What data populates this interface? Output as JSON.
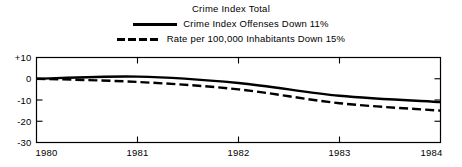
{
  "chart_data": {
    "type": "line",
    "title": "Crime Index Total",
    "xlabel": "",
    "ylabel": "",
    "x": [
      1980,
      1981,
      1982,
      1983,
      1984
    ],
    "xtick_labels": [
      "1980",
      "1981",
      "1982",
      "1983",
      "1984"
    ],
    "ytick_labels": [
      "+10",
      "0",
      "-10",
      "-20",
      "-30"
    ],
    "ytick_values": [
      10,
      0,
      -10,
      -20,
      -30
    ],
    "xlim": [
      1980,
      1984
    ],
    "ylim": [
      -30,
      10
    ],
    "grid": false,
    "legend_position": "top-center",
    "series": [
      {
        "name": "Crime Index Offenses Down 11%",
        "style": "solid",
        "color": "#000000",
        "values": [
          0,
          1,
          -2,
          -8,
          -11
        ]
      },
      {
        "name": "Rate per 100,000 Inhabitants Down 15%",
        "style": "dashed",
        "color": "#000000",
        "values": [
          0,
          -1.5,
          -5,
          -11.5,
          -15
        ]
      }
    ]
  },
  "legend": {
    "title": "Crime Index Total",
    "entries": [
      {
        "swatch": "solid-line-swatch",
        "label": "Crime Index Offenses Down 11%"
      },
      {
        "swatch": "dashed-line-swatch",
        "label": "Rate per 100,000 Inhabitants Down 15%"
      }
    ]
  },
  "axes": {
    "y_labels": [
      "+10",
      "0",
      "-10",
      "-20",
      "-30"
    ],
    "x_labels": [
      "1980",
      "1981",
      "1982",
      "1983",
      "1984"
    ]
  }
}
